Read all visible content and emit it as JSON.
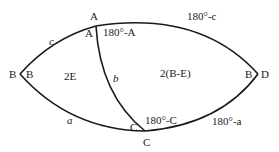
{
  "diagram": {
    "vertices": {
      "A_outer": "A",
      "A_inner": "A",
      "B_left_outer": "B",
      "B_left_inner": "B",
      "B_right": "B",
      "D_right": "D",
      "C_inner": "C",
      "C_outer": "C"
    },
    "angle_labels": {
      "supp_A": "180°-A",
      "supp_C": "180°-C"
    },
    "side_labels": {
      "c": "c",
      "a": "a",
      "b": "b",
      "supp_c": "180°-c",
      "supp_a": "180°-a"
    },
    "region_labels": {
      "left": "2E",
      "right": "2(B-E)"
    },
    "colors": {
      "stroke": "#1a1a1a",
      "background": "#ffffff"
    }
  }
}
